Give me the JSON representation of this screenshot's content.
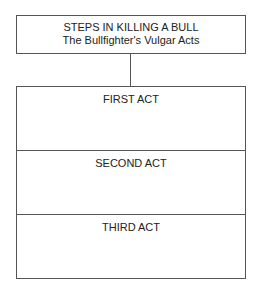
{
  "diagram": {
    "header": {
      "title": "STEPS IN KILLING A BULL",
      "subtitle": "The Bullfighter's Vulgar Acts"
    },
    "acts": [
      {
        "label": "FIRST ACT"
      },
      {
        "label": "SECOND ACT"
      },
      {
        "label": "THIRD ACT"
      }
    ],
    "colors": {
      "line": "#555555",
      "text": "#222222",
      "background": "#ffffff"
    }
  }
}
